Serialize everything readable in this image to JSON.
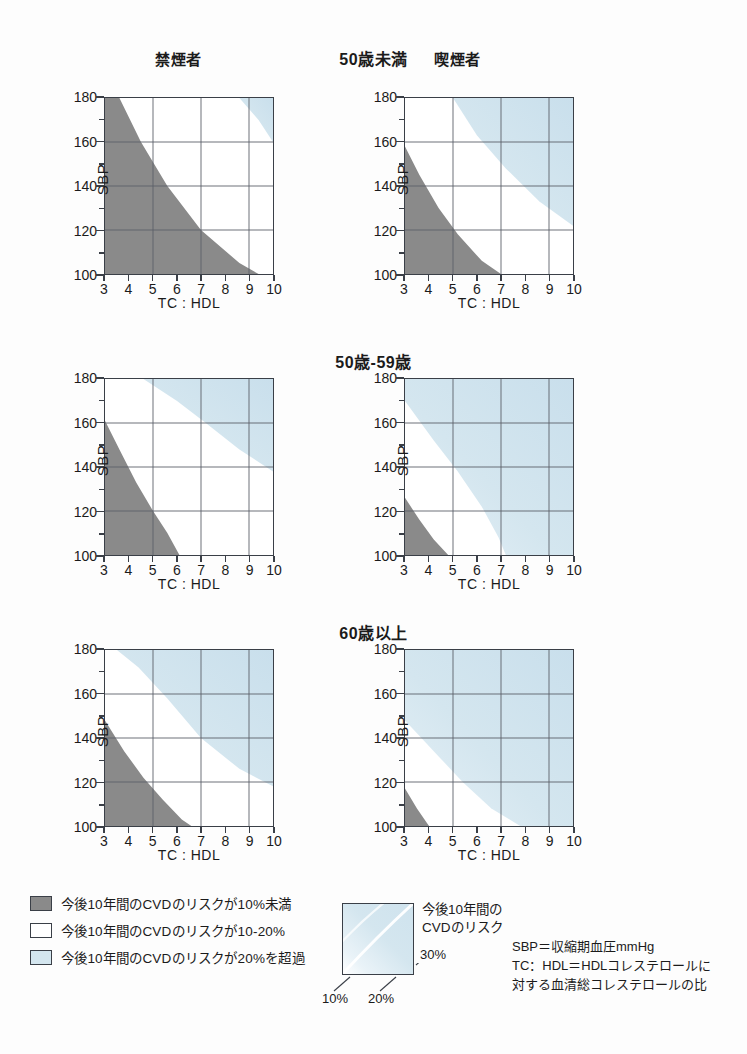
{
  "columns": [
    {
      "label": "禁煙者"
    },
    {
      "label": "喫煙者"
    }
  ],
  "rows": [
    {
      "label": "50歳未満"
    },
    {
      "label": "50歳-59歳"
    },
    {
      "label": "60歳以上"
    }
  ],
  "axes": {
    "ylabel": "SBP",
    "xlabel": "TC : HDL",
    "yticks": [
      "100",
      "120",
      "140",
      "160",
      "180"
    ],
    "xticks": [
      "3",
      "4",
      "5",
      "6",
      "7",
      "8",
      "9",
      "10"
    ],
    "ymin": 100,
    "ymax": 180,
    "xmin": 3,
    "xmax": 10
  },
  "colors": {
    "low_risk_gray": "#8a8a8a",
    "mid_risk_white": "#ffffff",
    "high_risk_blue": "#d4e6ef",
    "axis": "#3a3f47",
    "grid": "#5a6068"
  },
  "legend": {
    "items": [
      {
        "swatch": "gray",
        "text": "今後10年間のCVDのリスクが10%未満"
      },
      {
        "swatch": "white",
        "text": "今後10年間のCVDのリスクが10-20%"
      },
      {
        "swatch": "blue",
        "text": "今後10年間のCVDのリスクが20%を超過"
      }
    ],
    "gradient_caption_line1": "今後10年間の",
    "gradient_caption_line2": "CVDのリスク",
    "gradient_labels": {
      "low": "10%",
      "mid": "20%",
      "high": "30%"
    }
  },
  "notes": {
    "line1": "SBP＝収縮期血圧mmHg",
    "line2": "TC：HDL＝HDLコレステロールに",
    "line3": "対する血清総コレステロールの比"
  },
  "chart_data": {
    "type": "heatmap",
    "title": "",
    "xlabel": "TC : HDL",
    "ylabel": "SBP",
    "xlim": [
      3,
      10
    ],
    "ylim": [
      100,
      180
    ],
    "grid": true,
    "legend_position": "bottom",
    "bands": [
      "<10%",
      "10-20%",
      ">20%"
    ],
    "panels": [
      {
        "age": "50歳未満",
        "smoking": "禁煙者",
        "gray_boundary": [
          [
            3,
            180
          ],
          [
            3.6,
            180
          ],
          [
            4.5,
            160
          ],
          [
            5.6,
            140
          ],
          [
            7.0,
            120
          ],
          [
            8.6,
            105
          ],
          [
            9.4,
            100
          ],
          [
            3,
            100
          ]
        ],
        "blue_boundary": [
          [
            8.6,
            180
          ],
          [
            10,
            180
          ],
          [
            10,
            160
          ],
          [
            9.4,
            170
          ]
        ]
      },
      {
        "age": "50歳未満",
        "smoking": "喫煙者",
        "gray_boundary": [
          [
            3,
            158
          ],
          [
            3.6,
            145
          ],
          [
            4.4,
            130
          ],
          [
            5.2,
            118
          ],
          [
            6.2,
            106
          ],
          [
            7.0,
            100
          ],
          [
            3,
            100
          ]
        ],
        "blue_boundary": [
          [
            5.0,
            180
          ],
          [
            10,
            180
          ],
          [
            10,
            122
          ],
          [
            8.6,
            133
          ],
          [
            7.2,
            148
          ],
          [
            6.0,
            163
          ],
          [
            5.0,
            180
          ]
        ]
      },
      {
        "age": "50歳-59歳",
        "smoking": "禁煙者",
        "gray_boundary": [
          [
            3,
            161
          ],
          [
            3.6,
            148
          ],
          [
            4.3,
            133
          ],
          [
            5.0,
            120
          ],
          [
            5.6,
            110
          ],
          [
            6.1,
            100
          ],
          [
            3,
            100
          ]
        ],
        "blue_boundary": [
          [
            4.6,
            180
          ],
          [
            10,
            180
          ],
          [
            10,
            138
          ],
          [
            8.6,
            148
          ],
          [
            7.2,
            160
          ],
          [
            6.0,
            170
          ],
          [
            4.6,
            180
          ]
        ]
      },
      {
        "age": "50歳-59歳",
        "smoking": "喫煙者",
        "gray_boundary": [
          [
            3,
            126
          ],
          [
            3.6,
            116
          ],
          [
            4.2,
            107
          ],
          [
            4.8,
            100
          ],
          [
            3,
            100
          ]
        ],
        "blue_boundary": [
          [
            3,
            170
          ],
          [
            4.2,
            152
          ],
          [
            5.2,
            138
          ],
          [
            6.2,
            122
          ],
          [
            6.9,
            108
          ],
          [
            7.2,
            100
          ],
          [
            10,
            100
          ],
          [
            10,
            180
          ],
          [
            3,
            180
          ]
        ]
      },
      {
        "age": "60歳以上",
        "smoking": "禁煙者",
        "gray_boundary": [
          [
            3,
            148
          ],
          [
            3.8,
            134
          ],
          [
            4.6,
            122
          ],
          [
            5.4,
            112
          ],
          [
            6.2,
            103
          ],
          [
            6.6,
            100
          ],
          [
            3,
            100
          ]
        ],
        "blue_boundary": [
          [
            3.5,
            180
          ],
          [
            10,
            180
          ],
          [
            10,
            118
          ],
          [
            8.6,
            126
          ],
          [
            7.0,
            140
          ],
          [
            5.6,
            158
          ],
          [
            4.4,
            172
          ],
          [
            3.5,
            180
          ]
        ]
      },
      {
        "age": "60歳以上",
        "smoking": "喫煙者",
        "gray_boundary": [
          [
            3,
            117
          ],
          [
            3.5,
            108
          ],
          [
            4.0,
            100
          ],
          [
            3,
            100
          ]
        ],
        "blue_boundary": [
          [
            3,
            148
          ],
          [
            4.2,
            134
          ],
          [
            5.4,
            120
          ],
          [
            6.6,
            108
          ],
          [
            7.8,
            100
          ],
          [
            10,
            100
          ],
          [
            10,
            180
          ],
          [
            3,
            180
          ]
        ]
      }
    ]
  }
}
